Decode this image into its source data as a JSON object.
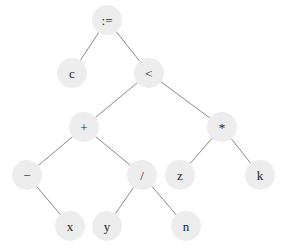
{
  "diagram": {
    "type": "expression-tree",
    "nodes": [
      {
        "id": "assign",
        "label": ":="
      },
      {
        "id": "c",
        "label": "c"
      },
      {
        "id": "lt",
        "label": "<"
      },
      {
        "id": "plus",
        "label": "+"
      },
      {
        "id": "mul",
        "label": "*"
      },
      {
        "id": "minus",
        "label": "−"
      },
      {
        "id": "div",
        "label": "/"
      },
      {
        "id": "z",
        "label": "z"
      },
      {
        "id": "k",
        "label": "k"
      },
      {
        "id": "x",
        "label": "x"
      },
      {
        "id": "y",
        "label": "y"
      },
      {
        "id": "n",
        "label": "n"
      }
    ],
    "edges": [
      {
        "from": "assign",
        "to": "c"
      },
      {
        "from": "assign",
        "to": "lt"
      },
      {
        "from": "lt",
        "to": "plus"
      },
      {
        "from": "lt",
        "to": "mul"
      },
      {
        "from": "plus",
        "to": "minus"
      },
      {
        "from": "plus",
        "to": "div"
      },
      {
        "from": "mul",
        "to": "z"
      },
      {
        "from": "mul",
        "to": "k"
      },
      {
        "from": "minus",
        "to": "x"
      },
      {
        "from": "div",
        "to": "y"
      },
      {
        "from": "div",
        "to": "n"
      }
    ]
  }
}
